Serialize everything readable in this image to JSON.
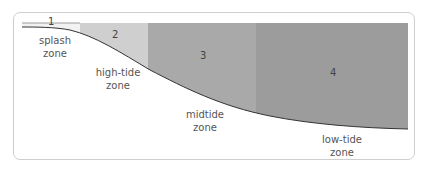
{
  "diagram": {
    "type": "intertidal-zones-cross-section",
    "zones": [
      {
        "number": "1",
        "name_line1": "splash",
        "name_line2": "zone",
        "color": "#f2f2f2"
      },
      {
        "number": "2",
        "name_line1": "high-tide",
        "name_line2": "zone",
        "color": "#cfcfcf"
      },
      {
        "number": "3",
        "name_line1": "midtide",
        "name_line2": "zone",
        "color": "#a9a9a9"
      },
      {
        "number": "4",
        "name_line1": "low-tide",
        "name_line2": "zone",
        "color": "#9c9c9c"
      }
    ],
    "colors": {
      "frame_border": "#cfcfcf",
      "shore_line": "#333333"
    }
  }
}
